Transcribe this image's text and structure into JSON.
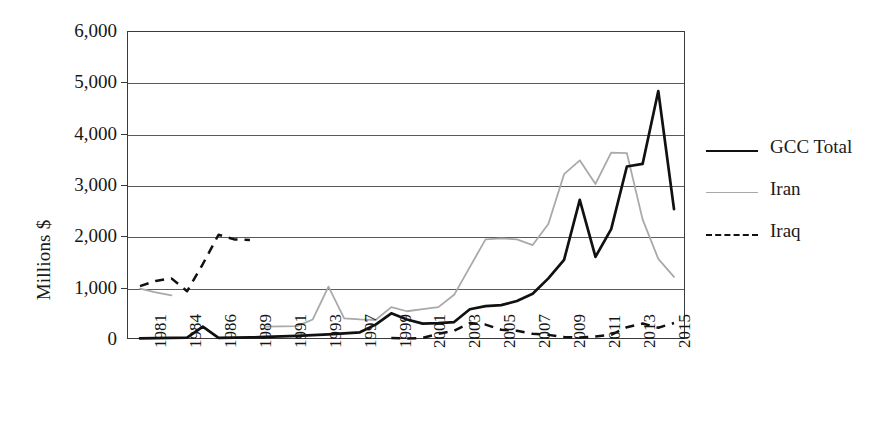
{
  "chart_data": {
    "type": "line",
    "title": "",
    "xlabel": "",
    "ylabel": "Millions $",
    "ylim": [
      0,
      6000
    ],
    "ytick_values": [
      0,
      1000,
      2000,
      3000,
      4000,
      5000,
      6000
    ],
    "ytick_labels": [
      "0",
      "1,000",
      "2,000",
      "3,000",
      "4,000",
      "5,000",
      "6,000"
    ],
    "grid": "horizontal",
    "legend_position": "right",
    "x_axis_label_rotation": "-90",
    "xtick_labels": [
      "1981",
      "1984",
      "1986",
      "1989",
      "1991",
      "1993",
      "1997",
      "1999",
      "2001",
      "2003",
      "2005",
      "2007",
      "2009",
      "2011",
      "2013",
      "2015"
    ],
    "x": [
      1981,
      1982,
      1983,
      1984,
      1985,
      1986,
      1987,
      1988,
      1989,
      1990,
      1991,
      1992,
      1993,
      1994,
      1995,
      1996,
      1997,
      1998,
      1999,
      2000,
      2001,
      2002,
      2003,
      2004,
      2005,
      2006,
      2007,
      2008,
      2009,
      2010,
      2011,
      2012,
      2013,
      2014,
      2015
    ],
    "series": [
      {
        "name": "GCC Total",
        "style": "solid",
        "color": "#111111",
        "values": [
          30,
          35,
          40,
          45,
          260,
          40,
          45,
          50,
          60,
          70,
          80,
          95,
          110,
          130,
          150,
          300,
          520,
          400,
          320,
          330,
          350,
          600,
          660,
          680,
          760,
          900,
          1200,
          1560,
          2730,
          1620,
          2160,
          3380,
          3430,
          4850,
          2550
        ]
      },
      {
        "name": "Iran",
        "style": "thin",
        "color": "#a9a9a9",
        "values": [
          1000,
          930,
          870,
          null,
          null,
          null,
          null,
          null,
          260,
          265,
          270,
          400,
          1040,
          420,
          400,
          390,
          640,
          560,
          600,
          640,
          880,
          1420,
          1960,
          1980,
          1960,
          1850,
          2260,
          3230,
          3500,
          3040,
          3650,
          3640,
          2350,
          1580,
          1230
        ]
      },
      {
        "name": "Iraq",
        "style": "dashed",
        "color": "#111111",
        "values": [
          1050,
          1150,
          1200,
          950,
          1480,
          2050,
          1960,
          1950,
          null,
          null,
          null,
          null,
          null,
          null,
          null,
          null,
          40,
          30,
          40,
          120,
          180,
          330,
          300,
          200,
          180,
          120,
          100,
          60,
          50,
          70,
          100,
          250,
          320,
          240,
          330
        ]
      }
    ]
  },
  "legend": {
    "items": [
      {
        "label": "GCC Total",
        "style": "solid"
      },
      {
        "label": "Iran",
        "style": "thin"
      },
      {
        "label": "Iraq",
        "style": "dashed"
      }
    ]
  }
}
